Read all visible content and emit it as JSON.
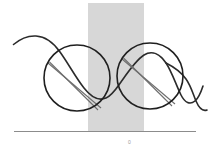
{
  "figure": {
    "title": "",
    "caption": "",
    "background_color": "#ffffff",
    "width": 216,
    "height": 154
  },
  "colors": {
    "curve": "#2b2b2b",
    "circle_outline": "#1f1f1f",
    "chord": "#6e6e6e",
    "band_fill": "#d7d7d7",
    "axis": "#8c8c8c",
    "tick_label": "#9a9a9a"
  },
  "band": {
    "name": "shaded-vertical-band",
    "x": 88,
    "y": 3,
    "width": 56,
    "height": 129,
    "fill": "#d7d7d7"
  },
  "axis": {
    "name": "baseline-axis",
    "x1": 14,
    "y1": 131.5,
    "x2": 196,
    "y2": 131.5,
    "stroke": "#8c8c8c",
    "stroke_width": 1.2
  },
  "tick": {
    "label": "0",
    "x": 130,
    "y": 143
  },
  "circles": [
    {
      "name": "circle-left",
      "cx": 77,
      "cy": 78,
      "r": 33,
      "stroke": "#1f1f1f",
      "stroke_width": 1.6,
      "chords": [
        {
          "x1": 48,
          "y1": 63,
          "x2": 101,
          "y2": 108
        },
        {
          "x1": 49.5,
          "y1": 62,
          "x2": 98,
          "y2": 110
        }
      ]
    },
    {
      "name": "circle-right",
      "cx": 150,
      "cy": 76,
      "r": 33,
      "stroke": "#1f1f1f",
      "stroke_width": 1.6,
      "chords": [
        {
          "x1": 122,
          "y1": 59,
          "x2": 175,
          "y2": 104
        },
        {
          "x1": 123.5,
          "y1": 58,
          "x2": 172,
          "y2": 106
        }
      ]
    }
  ],
  "curve": {
    "name": "oscillating-curve",
    "stroke": "#2b2b2b",
    "stroke_width": 1.6,
    "path": "M 13.5 44.5 C 20 39 28 35.5 36 36 C 46 36.5 54 43.5 60 52 C 68 63 76 78 84 88 C 91 97 99 101 106 98 C 112 95.5 116 89 121 82 C 128 72 136 60 144 55 C 152 50 160 54 166 63 C 172 72 176 85 181 95 C 185 103 190 105 195 101 C 199 98 201 92 203 86"
  },
  "curve_tail": {
    "name": "curve-tail-right",
    "path": "M 166 63 C 174 67 181 72 186 79 C 191 86 193 94 196 101 C 199 108 202 112 207 110"
  },
  "chart_data": {
    "type": "line",
    "title": "",
    "xlabel": "",
    "ylabel": "",
    "annotations": [
      "circle-left",
      "circle-right",
      "shaded-vertical-band"
    ],
    "tick_labels": [
      "0"
    ]
  }
}
